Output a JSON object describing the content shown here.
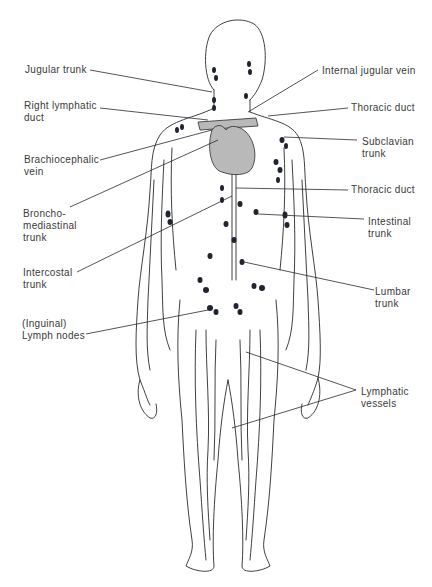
{
  "diagram": {
    "colors": {
      "line": "#2a2a2a",
      "heart": "#b9b9b9",
      "node": "#1f2430",
      "text": "#3a3a3a"
    },
    "labels_left": [
      {
        "id": "jugular-trunk",
        "text": "Jugular trunk"
      },
      {
        "id": "right-lymphatic-duct",
        "text": "Right lymphatic\nduct"
      },
      {
        "id": "brachiocephalic-vein",
        "text": "Brachiocephalic\nvein"
      },
      {
        "id": "bronchomediastinal-trunk",
        "text": "Broncho-\nmediastinal\ntrunk"
      },
      {
        "id": "intercostal-trunk",
        "text": "Intercostal\ntrunk"
      },
      {
        "id": "inguinal-lymph-nodes",
        "text": "(Inguinal)\nLymph nodes"
      }
    ],
    "labels_right": [
      {
        "id": "internal-jugular-vein",
        "text": "Internal jugular vein"
      },
      {
        "id": "thoracic-duct-upper",
        "text": "Thoracic duct"
      },
      {
        "id": "subclavian-trunk",
        "text": "Subclavian\ntrunk"
      },
      {
        "id": "thoracic-duct-lower",
        "text": "Thoracic duct"
      },
      {
        "id": "intestinal-trunk",
        "text": "Intestinal\ntrunk"
      },
      {
        "id": "lumbar-trunk",
        "text": "Lumbar\ntrunk"
      },
      {
        "id": "lymphatic-vessels",
        "text": "Lymphatic\nvessels"
      }
    ]
  }
}
